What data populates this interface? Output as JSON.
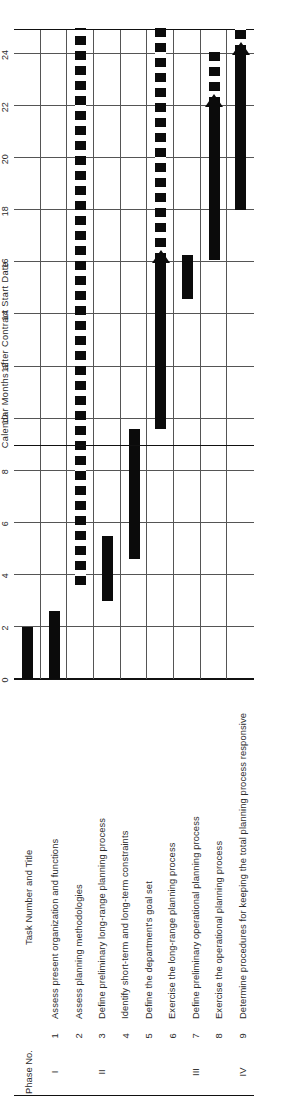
{
  "chart_data": {
    "type": "bar",
    "subtype": "gantt",
    "title": "",
    "xlabel": "Calendar Months after Contract Start Date",
    "ylabel": "",
    "xlim": [
      0,
      25
    ],
    "ticks": [
      0,
      2,
      4,
      6,
      8,
      10,
      12,
      14,
      16,
      18,
      20,
      22,
      24
    ],
    "grid": true,
    "legend": "",
    "bar_color": "#0b0b0b",
    "categories": [
      "1 Assess present organization and functions",
      "2 Assess planning methodologies",
      "3 Define preliminary long-range planning process",
      "4 Identify short-term and long-term constraints",
      "5 Define the department's goal set",
      "6 Exercise the long-range planning process",
      "7 Define preliminary operational planning process",
      "8 Exercise the operational planning process",
      "9 Determine procedures for keeping the total planning process responsive"
    ],
    "tasks": [
      {
        "task": 1,
        "start": 0.0,
        "end": 2.0,
        "style": "solid",
        "milestone": false
      },
      {
        "task": 2,
        "start": 0.0,
        "end": 2.6,
        "style": "solid",
        "milestone": false
      },
      {
        "task": 3,
        "start": 3.6,
        "end": 25.0,
        "style": "dashed",
        "milestone": false
      },
      {
        "task": 4,
        "start": 3.0,
        "end": 5.5,
        "style": "solid",
        "milestone": false
      },
      {
        "task": 5,
        "start": 4.6,
        "end": 9.6,
        "style": "solid",
        "milestone": false
      },
      {
        "task": 6,
        "start": 9.6,
        "end": 16.0,
        "style": "solid",
        "milestone": true,
        "continuation": {
          "start": 16.0,
          "end": 25.0,
          "style": "dashed"
        }
      },
      {
        "task": 7,
        "start": 14.6,
        "end": 16.3,
        "style": "solid",
        "milestone": false
      },
      {
        "task": 8,
        "start": 16.1,
        "end": 22.0,
        "style": "solid",
        "milestone": true,
        "continuation": {
          "start": 22.0,
          "end": 24.2,
          "style": "dashed"
        }
      },
      {
        "task": 9,
        "start": 18.0,
        "end": 24.0,
        "style": "solid",
        "milestone": true,
        "continuation": {
          "start": 24.0,
          "end": 25.0,
          "style": "dashed"
        }
      }
    ]
  },
  "axis": {
    "title": "Calendar Months after Contract Start Date",
    "tick_labels": [
      "0",
      "2",
      "4",
      "6",
      "8",
      "10",
      "12",
      "14",
      "16",
      "18",
      "20",
      "22",
      "24"
    ]
  },
  "table": {
    "headers": {
      "phase": "Phase No.",
      "number_and_title": "Task Number and Title"
    },
    "rows": [
      {
        "phase": "I",
        "num": "1",
        "title": "Assess present organization and functions"
      },
      {
        "phase": "",
        "num": "2",
        "title": "Assess planning methodologies"
      },
      {
        "phase": "II",
        "num": "3",
        "title": "Define preliminary long-range planning process"
      },
      {
        "phase": "",
        "num": "4",
        "title": "Identify short-term and long-term constraints"
      },
      {
        "phase": "",
        "num": "5",
        "title": "Define the department's goal set"
      },
      {
        "phase": "",
        "num": "6",
        "title": "Exercise the long-range planning process"
      },
      {
        "phase": "III",
        "num": "7",
        "title": "Define preliminary operational planning process"
      },
      {
        "phase": "",
        "num": "8",
        "title": "Exercise the operational planning process"
      },
      {
        "phase": "IV",
        "num": "9",
        "title": "Determine procedures for keeping the total planning process responsive"
      }
    ]
  }
}
